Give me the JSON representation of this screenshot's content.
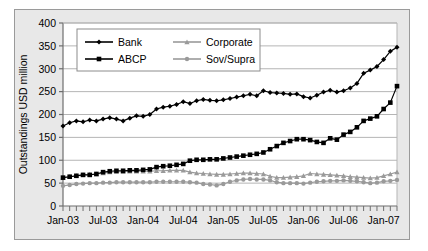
{
  "chart_data": {
    "type": "line",
    "title": "",
    "xlabel": "",
    "ylabel": "Outstandings USD million",
    "ylim": [
      0,
      400
    ],
    "ytick_step": 50,
    "yticks": [
      0,
      50,
      100,
      150,
      200,
      250,
      300,
      350,
      400
    ],
    "grid": true,
    "grid_axis": "y",
    "legend_position": "top-left-inside",
    "x_tick_labels": [
      "Jan-03",
      "Jul-03",
      "Jan-04",
      "Jul-04",
      "Jan-05",
      "Jul-05",
      "Jan-06",
      "Jul-06",
      "Jan-07"
    ],
    "x_minor_tick_interval_months": 1,
    "x_label_interval_months": 6,
    "x": [
      "Jan-03",
      "Feb-03",
      "Mar-03",
      "Apr-03",
      "May-03",
      "Jun-03",
      "Jul-03",
      "Aug-03",
      "Sep-03",
      "Oct-03",
      "Nov-03",
      "Dec-03",
      "Jan-04",
      "Feb-04",
      "Mar-04",
      "Apr-04",
      "May-04",
      "Jun-04",
      "Jul-04",
      "Aug-04",
      "Sep-04",
      "Oct-04",
      "Nov-04",
      "Dec-04",
      "Jan-05",
      "Feb-05",
      "Mar-05",
      "Apr-05",
      "May-05",
      "Jun-05",
      "Jul-05",
      "Aug-05",
      "Sep-05",
      "Oct-05",
      "Nov-05",
      "Dec-05",
      "Jan-06",
      "Feb-06",
      "Mar-06",
      "Apr-06",
      "May-06",
      "Jun-06",
      "Jul-06",
      "Aug-06",
      "Sep-06",
      "Oct-06",
      "Nov-06",
      "Dec-06",
      "Jan-07",
      "Feb-07",
      "Mar-07"
    ],
    "series": [
      {
        "name": "Bank",
        "color": "#000000",
        "marker": "diamond",
        "values": [
          175,
          182,
          186,
          184,
          188,
          186,
          190,
          193,
          190,
          186,
          192,
          197,
          196,
          200,
          212,
          216,
          218,
          222,
          228,
          224,
          230,
          233,
          231,
          230,
          232,
          235,
          238,
          241,
          244,
          241,
          252,
          248,
          247,
          246,
          244,
          245,
          239,
          236,
          242,
          249,
          253,
          249,
          252,
          258,
          268,
          290,
          297,
          305,
          320,
          338,
          347
        ]
      },
      {
        "name": "ABCP",
        "color": "#000000",
        "marker": "square",
        "values": [
          62,
          64,
          66,
          68,
          68,
          70,
          74,
          76,
          77,
          77,
          78,
          78,
          79,
          80,
          85,
          87,
          88,
          90,
          92,
          99,
          101,
          101,
          102,
          102,
          104,
          106,
          108,
          110,
          112,
          114,
          117,
          124,
          131,
          138,
          142,
          146,
          146,
          144,
          140,
          138,
          148,
          145,
          156,
          162,
          172,
          186,
          191,
          196,
          212,
          226,
          262
        ]
      },
      {
        "name": "Corporate",
        "color": "#9a9a9a",
        "marker": "triangle",
        "values": [
          62,
          64,
          66,
          68,
          69,
          70,
          72,
          74,
          75,
          75,
          76,
          76,
          76,
          76,
          77,
          77,
          78,
          78,
          78,
          74,
          72,
          71,
          70,
          69,
          69,
          70,
          71,
          72,
          72,
          71,
          70,
          65,
          62,
          62,
          63,
          64,
          66,
          71,
          70,
          69,
          68,
          67,
          66,
          64,
          63,
          62,
          61,
          62,
          66,
          70,
          74
        ]
      },
      {
        "name": "Sov/Supra",
        "color": "#9a9a9a",
        "marker": "circle",
        "values": [
          44,
          46,
          48,
          49,
          50,
          50,
          51,
          51,
          52,
          52,
          52,
          52,
          52,
          52,
          53,
          53,
          53,
          53,
          53,
          52,
          51,
          48,
          47,
          45,
          48,
          53,
          56,
          58,
          59,
          58,
          58,
          56,
          52,
          50,
          50,
          50,
          49,
          51,
          53,
          54,
          55,
          55,
          56,
          55,
          54,
          52,
          50,
          51,
          54,
          55,
          57
        ]
      }
    ]
  },
  "legend": {
    "entries": [
      {
        "label": "Bank"
      },
      {
        "label": "Corporate"
      },
      {
        "label": "ABCP"
      },
      {
        "label": "Sov/Supra"
      }
    ]
  },
  "colors": {
    "series_black": "#000000",
    "series_gray": "#9a9a9a",
    "plot_background": "#ffffff",
    "chart_background": "#e8e8e8",
    "gridline": "#b5b5b5",
    "axis": "#6e6e6e"
  }
}
